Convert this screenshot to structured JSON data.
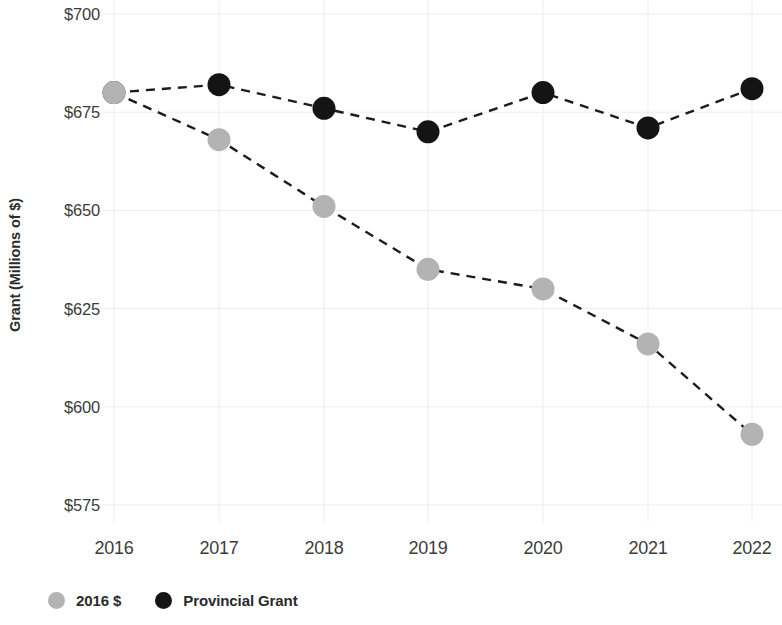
{
  "chart_data": {
    "type": "line",
    "title": "",
    "subtitle": "",
    "xlabel": "",
    "ylabel": "Grant (Millions of $)",
    "categories": [
      "2016",
      "2017",
      "2018",
      "2019",
      "2020",
      "2021",
      "2022"
    ],
    "x": [
      2016,
      2017,
      2018,
      2019,
      2020,
      2021,
      2022
    ],
    "series": [
      {
        "name": "2016 $",
        "color": "#b3b3b3",
        "marker": "circle",
        "linestyle": "dashed",
        "values": [
          680,
          668,
          651,
          635,
          630,
          616,
          593
        ]
      },
      {
        "name": "Provincial Grant",
        "color": "#141414",
        "marker": "circle",
        "linestyle": "dashed",
        "values": [
          680,
          682,
          676,
          670,
          680,
          671,
          681
        ]
      }
    ],
    "ylim": [
      575,
      700
    ],
    "yticks": [
      700,
      675,
      650,
      625,
      600,
      575
    ],
    "ytick_labels": [
      "$700",
      "$675",
      "$650",
      "$625",
      "$600",
      "$575"
    ],
    "xtick_labels": [
      "2016",
      "2017",
      "2018",
      "2019",
      "2020",
      "2021",
      "2022"
    ],
    "grid": true,
    "grid_color": "#ededed",
    "legend_position": "bottom-left",
    "background": "#ffffff"
  },
  "legend": {
    "items": [
      {
        "label": "2016 $",
        "color": "#b3b3b3"
      },
      {
        "label": "Provincial Grant",
        "color": "#141414"
      }
    ]
  }
}
